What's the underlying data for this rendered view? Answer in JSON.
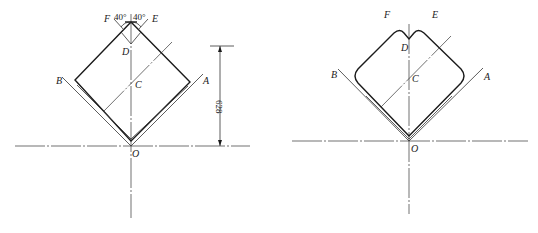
{
  "figures": [
    {
      "id": "left",
      "labels": {
        "F": "F",
        "E": "E",
        "D": "D",
        "C": "C",
        "B": "B",
        "A": "A",
        "O": "O"
      },
      "angles": {
        "left": "40°",
        "right": "40°"
      },
      "dimension": "628"
    },
    {
      "id": "right",
      "labels": {
        "F": "F",
        "E": "E",
        "D": "D",
        "C": "C",
        "B": "B",
        "A": "A",
        "O": "O"
      }
    }
  ]
}
